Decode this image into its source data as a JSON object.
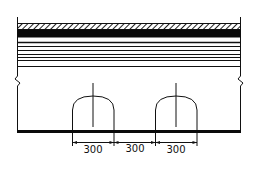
{
  "diagram": {
    "type": "section-drawing",
    "colors": {
      "line": "#111111",
      "background": "#ffffff"
    },
    "layers": [
      {
        "name": "hatched-top-layer",
        "style": "hatched"
      },
      {
        "name": "solid-black-layer",
        "style": "solid"
      },
      {
        "name": "thin-layer-1",
        "style": "line"
      },
      {
        "name": "thin-layer-2",
        "style": "line"
      },
      {
        "name": "thin-layer-3",
        "style": "line"
      },
      {
        "name": "thin-layer-4",
        "style": "line"
      },
      {
        "name": "thin-layer-5",
        "style": "line"
      },
      {
        "name": "thin-layer-6",
        "style": "line"
      },
      {
        "name": "bottom-layer-line",
        "style": "line"
      }
    ],
    "openings": [
      {
        "name": "arch-opening-1"
      },
      {
        "name": "arch-opening-2"
      }
    ],
    "dimensions": [
      {
        "label": "300"
      },
      {
        "label": "300"
      },
      {
        "label": "300"
      }
    ],
    "break_symbols": [
      "left-break",
      "right-break"
    ]
  }
}
